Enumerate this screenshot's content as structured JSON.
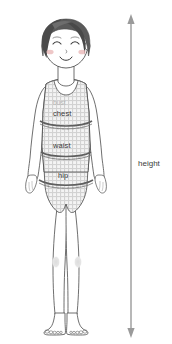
{
  "illustration": {
    "title": "body-measurement-diagram",
    "subject": "child-figure-front-view",
    "background_color": "#ffffff"
  },
  "labels": {
    "bust": "bust",
    "chest": "chest",
    "waist": "waist",
    "hip": "hip",
    "height": "height"
  },
  "colors": {
    "outline": "#4a4a4a",
    "hair": "#5a5a5a",
    "hair_shadow": "#3d3d3d",
    "skin_line": "#555555",
    "cheek": "#e8b4b4",
    "garment_check": "#cfcfcf",
    "garment_fill": "#f2f2f2",
    "tape": "#6b6b6b",
    "tape_dark": "#4f4f4f",
    "arrow": "#999999",
    "knee_shade": "#e0e0e0",
    "label_text": "#3a3a3a",
    "label_faint": "#b4b4b4"
  },
  "arrow": {
    "orientation": "vertical",
    "double_headed": true,
    "x": 131,
    "top_y": 18,
    "bottom_y": 334
  }
}
